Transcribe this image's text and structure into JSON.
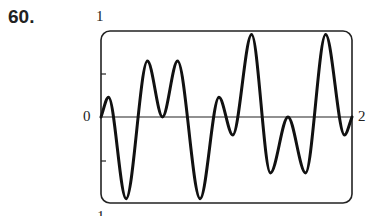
{
  "problem_number": "60.",
  "chart_data": {
    "type": "line",
    "title": "",
    "xlabel": "",
    "ylabel": "",
    "xlim": [
      0,
      2
    ],
    "ylim": [
      -1,
      1
    ],
    "tick_labels": {
      "y_top": "1",
      "y_bottom": "-1",
      "x_left": "0",
      "x_right": "2"
    },
    "y_ticks": [
      -0.5,
      0.5
    ],
    "grid": false,
    "series": [
      {
        "name": "f(x)",
        "x": [
          0,
          0.06,
          0.2,
          0.37,
          0.49,
          0.61,
          0.79,
          0.94,
          1.05,
          1.2,
          1.35,
          1.49,
          1.63,
          1.79,
          1.94,
          2.0
        ],
        "values": [
          0,
          0.23,
          -0.95,
          0.65,
          0.0,
          0.65,
          -0.95,
          0.23,
          -0.21,
          0.96,
          -0.65,
          0.0,
          -0.65,
          0.96,
          -0.21,
          0.0
        ]
      }
    ]
  }
}
